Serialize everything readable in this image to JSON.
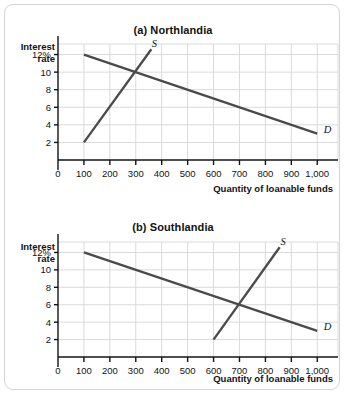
{
  "figure": {
    "border_color": "#d2d4d6",
    "background": "#ffffff",
    "axis_color": "#111314",
    "grid_color": "#d8dadb",
    "curve_color": "#4a4a4a"
  },
  "panels": [
    {
      "id": "a",
      "title": "(a) Northlandia",
      "ylabel_line1": "Interest",
      "ylabel_line2": "rate",
      "xlabel": "Quantity of loanable funds",
      "yticks": [
        "12%",
        "10",
        "8",
        "6",
        "4",
        "2"
      ],
      "ytick_values": [
        12,
        10,
        8,
        6,
        4,
        2
      ],
      "xticks": [
        "0",
        "100",
        "200",
        "300",
        "400",
        "500",
        "600",
        "700",
        "800",
        "900",
        "1,000"
      ],
      "xtick_values": [
        0,
        100,
        200,
        300,
        400,
        500,
        600,
        700,
        800,
        900,
        1000
      ],
      "supply_label": "S",
      "demand_label": "D"
    },
    {
      "id": "b",
      "title": "(b) Southlandia",
      "ylabel_line1": "Interest",
      "ylabel_line2": "rate",
      "xlabel": "Quantity of loanable funds",
      "yticks": [
        "12%",
        "10",
        "8",
        "6",
        "4",
        "2"
      ],
      "ytick_values": [
        12,
        10,
        8,
        6,
        4,
        2
      ],
      "xticks": [
        "0",
        "100",
        "200",
        "300",
        "400",
        "500",
        "600",
        "700",
        "800",
        "900",
        "1,000"
      ],
      "xtick_values": [
        0,
        100,
        200,
        300,
        400,
        500,
        600,
        700,
        800,
        900,
        1000
      ],
      "supply_label": "S",
      "demand_label": "D"
    }
  ],
  "chart_data": [
    {
      "type": "line",
      "title": "(a) Northlandia",
      "xlabel": "Quantity of loanable funds",
      "ylabel": "Interest rate",
      "xlim": [
        0,
        1080
      ],
      "ylim": [
        0,
        13.2
      ],
      "xticks": [
        0,
        100,
        200,
        300,
        400,
        500,
        600,
        700,
        800,
        900,
        1000
      ],
      "xtick_labels": [
        "0",
        "100",
        "200",
        "300",
        "400",
        "500",
        "600",
        "700",
        "800",
        "900",
        "1,000"
      ],
      "yticks": [
        2,
        4,
        6,
        8,
        10,
        12
      ],
      "ytick_labels": [
        "2",
        "4",
        "6",
        "8",
        "10",
        "12%"
      ],
      "grid": true,
      "legend": "inline-curve-labels",
      "series": [
        {
          "name": "D",
          "label": "Demand",
          "points": [
            [
              100,
              12
            ],
            [
              1000,
              3
            ]
          ],
          "label_position": [
            1040,
            3.1
          ]
        },
        {
          "name": "S",
          "label": "Supply",
          "points": [
            [
              100,
              2
            ],
            [
              360,
              12.6
            ]
          ],
          "label_position": [
            372,
            12.9
          ]
        }
      ],
      "equilibrium": {
        "quantity": 300,
        "interest_rate": 10
      }
    },
    {
      "type": "line",
      "title": "(b) Southlandia",
      "xlabel": "Quantity of loanable funds",
      "ylabel": "Interest rate",
      "xlim": [
        0,
        1080
      ],
      "ylim": [
        0,
        13.2
      ],
      "xticks": [
        0,
        100,
        200,
        300,
        400,
        500,
        600,
        700,
        800,
        900,
        1000
      ],
      "xtick_labels": [
        "0",
        "100",
        "200",
        "300",
        "400",
        "500",
        "600",
        "700",
        "800",
        "900",
        "1,000"
      ],
      "yticks": [
        2,
        4,
        6,
        8,
        10,
        12
      ],
      "ytick_labels": [
        "2",
        "4",
        "6",
        "8",
        "10",
        "12%"
      ],
      "grid": true,
      "legend": "inline-curve-labels",
      "series": [
        {
          "name": "D",
          "label": "Demand",
          "points": [
            [
              100,
              12
            ],
            [
              1000,
              3
            ]
          ],
          "label_position": [
            1040,
            3.1
          ]
        },
        {
          "name": "S",
          "label": "Supply",
          "points": [
            [
              600,
              2
            ],
            [
              855,
              12.6
            ]
          ],
          "label_position": [
            868,
            12.9
          ]
        }
      ],
      "equilibrium": {
        "quantity": 700,
        "interest_rate": 6
      }
    }
  ]
}
